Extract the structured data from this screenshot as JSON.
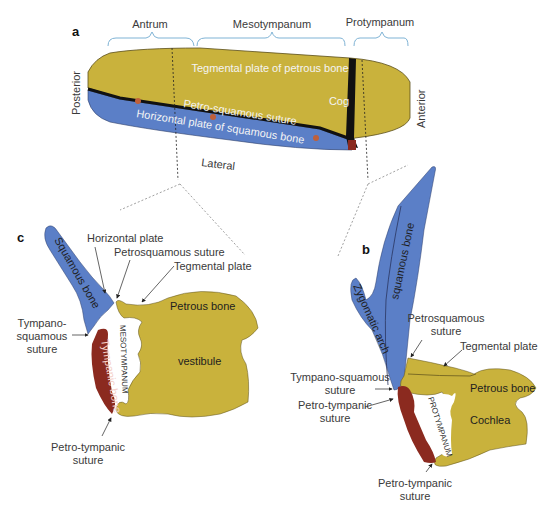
{
  "colors": {
    "petrous": "#c9b23c",
    "squamous": "#5b7fc7",
    "tympanic": "#8b2a1f",
    "brace": "#7fb3d5",
    "suture": "#111111",
    "dot": "#c0603a"
  },
  "panel_a": {
    "letter": "a",
    "regions": [
      "Antrum",
      "Mesotympanum",
      "Protympanum"
    ],
    "tegmental": "Tegmental plate of petrous bone",
    "suture": "Petro-squamous suture",
    "horizontal": "Horizontal plate of squamous bone",
    "cog": "Cog",
    "posterior": "Posterior",
    "anterior": "Anterior",
    "lateral": "Lateral"
  },
  "panel_c": {
    "letter": "c",
    "squamous_bone": "Squamous bone",
    "horizontal_plate": "Horizontal plate",
    "petrosquamous": "Petrosquamous suture",
    "tegmental": "Tegmental plate",
    "petrous_bone": "Petrous bone",
    "tympano_1": "Tympano-",
    "tympano_2": "squamous",
    "tympano_3": "suture",
    "tympanic_bone": "Tympanic bone",
    "mesotympanum": "MESOTYMPANUM",
    "vestibule": "vestibule",
    "petrotympanic_1": "Petro-tympanic",
    "petrotympanic_2": "suture"
  },
  "panel_b": {
    "letter": "b",
    "squamous_bone": "squamous bone",
    "zygomatic": "Zygomatic arch",
    "petrosquamous_1": "Petrosquamous",
    "petrosquamous_2": "suture",
    "tegmental": "Tegmental plate",
    "tympanosquamous_1": "Tympano-squamous",
    "tympanosquamous_2": "suture",
    "petrotympanic_1": "Petro-tympanic",
    "petrotympanic_2": "suture",
    "petrous_bone": "Petrous bone",
    "protympanum": "PROTYMPANUM",
    "cochlea": "Cochlea",
    "petrotympanic_b_1": "Petro-tympanic",
    "petrotympanic_b_2": "suture"
  }
}
